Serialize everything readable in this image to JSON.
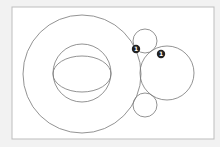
{
  "diagram": {
    "frame": {
      "x": 12,
      "y": 7,
      "width": 202,
      "height": 132,
      "fill": "#ffffff",
      "stroke": "#bdbdbd"
    },
    "stroke_color": "#777777",
    "circles": [
      {
        "name": "outer-circle",
        "cx": 82,
        "cy": 74,
        "r": 59
      },
      {
        "name": "inner-circle",
        "cx": 82,
        "cy": 73,
        "r": 29
      },
      {
        "name": "top-small-circle",
        "cx": 145,
        "cy": 41,
        "r": 12
      },
      {
        "name": "right-large-circle",
        "cx": 167,
        "cy": 73,
        "r": 27
      },
      {
        "name": "bottom-small-circle",
        "cx": 145,
        "cy": 105,
        "r": 12
      }
    ],
    "ellipse": {
      "name": "inner-ellipse",
      "cx": 82,
      "cy": 74,
      "rx": 29,
      "ry": 18
    },
    "markers": [
      {
        "label": "1",
        "cx": 136,
        "cy": 49,
        "r": 4.2
      },
      {
        "label": "1",
        "cx": 161,
        "cy": 54,
        "r": 4.2
      }
    ],
    "marker_color": "#222222"
  }
}
